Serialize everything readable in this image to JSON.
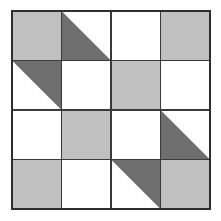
{
  "figure": {
    "type": "quilt-grid",
    "rows": 4,
    "columns": 4,
    "canvas_width": 221,
    "canvas_height": 221,
    "grid_left": 12,
    "grid_top": 11,
    "grid_right": 210,
    "grid_bottom": 209,
    "cell_width": 49.5,
    "cell_height": 49.5
  },
  "colors": {
    "background": "#ffffff",
    "light_gray": "#c0c0c0",
    "dark_gray": "#6e6e6e",
    "white": "#ffffff",
    "grid_line": "#3a3a3a",
    "border": "#2e2e2e"
  },
  "cells": [
    {
      "row": 0,
      "col": 0,
      "name": "cell-r1c1",
      "fill": "solid",
      "color": "light_gray",
      "triangle": null
    },
    {
      "row": 0,
      "col": 1,
      "name": "cell-r1c2",
      "fill": "triangle",
      "color": "dark_gray",
      "triangle": "lower-left"
    },
    {
      "row": 0,
      "col": 2,
      "name": "cell-r1c3",
      "fill": "solid",
      "color": "white",
      "triangle": null
    },
    {
      "row": 0,
      "col": 3,
      "name": "cell-r1c4",
      "fill": "solid",
      "color": "light_gray",
      "triangle": null
    },
    {
      "row": 1,
      "col": 0,
      "name": "cell-r2c1",
      "fill": "triangle",
      "color": "dark_gray",
      "triangle": "upper-right"
    },
    {
      "row": 1,
      "col": 1,
      "name": "cell-r2c2",
      "fill": "solid",
      "color": "white",
      "triangle": null
    },
    {
      "row": 1,
      "col": 2,
      "name": "cell-r2c3",
      "fill": "solid",
      "color": "light_gray",
      "triangle": null
    },
    {
      "row": 1,
      "col": 3,
      "name": "cell-r2c4",
      "fill": "solid",
      "color": "white",
      "triangle": null
    },
    {
      "row": 2,
      "col": 0,
      "name": "cell-r3c1",
      "fill": "solid",
      "color": "white",
      "triangle": null
    },
    {
      "row": 2,
      "col": 1,
      "name": "cell-r3c2",
      "fill": "solid",
      "color": "light_gray",
      "triangle": null
    },
    {
      "row": 2,
      "col": 2,
      "name": "cell-r3c3",
      "fill": "solid",
      "color": "white",
      "triangle": null
    },
    {
      "row": 2,
      "col": 3,
      "name": "cell-r3c4",
      "fill": "triangle",
      "color": "dark_gray",
      "triangle": "lower-left"
    },
    {
      "row": 3,
      "col": 0,
      "name": "cell-r4c1",
      "fill": "solid",
      "color": "light_gray",
      "triangle": null
    },
    {
      "row": 3,
      "col": 1,
      "name": "cell-r4c2",
      "fill": "solid",
      "color": "white",
      "triangle": null
    },
    {
      "row": 3,
      "col": 2,
      "name": "cell-r4c3",
      "fill": "triangle",
      "color": "dark_gray",
      "triangle": "upper-right"
    },
    {
      "row": 3,
      "col": 3,
      "name": "cell-r4c4",
      "fill": "solid",
      "color": "light_gray",
      "triangle": null
    }
  ]
}
